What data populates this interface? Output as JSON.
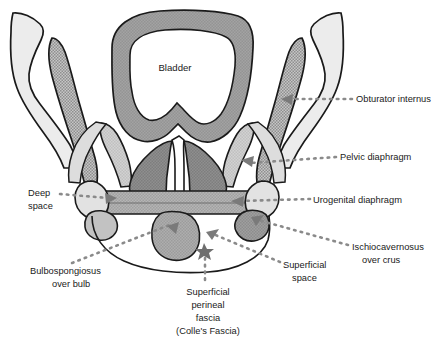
{
  "figure": {
    "background": "#ffffff"
  },
  "structures": {
    "bladder": {
      "label": "Bladder",
      "fill": "#9b9b9b",
      "stroke": "#1a1a1a"
    },
    "ilium_left": {
      "name": "ilium-left",
      "fill": "#e9e9e9",
      "stroke": "#1a1a1a"
    },
    "ilium_right": {
      "name": "ilium-right",
      "fill": "#e9e9e9",
      "stroke": "#1a1a1a"
    },
    "obturator_internus_left": {
      "name": "obturator-internus-left",
      "fill": "#b3b3b3",
      "stroke": "#1a1a1a"
    },
    "obturator_internus_right": {
      "name": "obturator-internus-right",
      "fill": "#b3b3b3",
      "stroke": "#1a1a1a"
    },
    "levator_ani_left": {
      "name": "pelvic-diaphragm-left",
      "fill": "#c9c9c9",
      "stroke": "#1a1a1a"
    },
    "levator_ani_right": {
      "name": "pelvic-diaphragm-right",
      "fill": "#c9c9c9",
      "stroke": "#1a1a1a"
    },
    "prostate_left": {
      "name": "prostate-lobe-left",
      "fill": "#8a8a8a",
      "stroke": "#1a1a1a"
    },
    "prostate_right": {
      "name": "prostate-lobe-right",
      "fill": "#8a8a8a",
      "stroke": "#1a1a1a"
    },
    "urethra": {
      "name": "urethra",
      "fill": "#ffffff",
      "stroke": "#1a1a1a"
    },
    "urogenital_diaphragm": {
      "name": "urogenital-diaphragm-band",
      "fill": "#adadad",
      "stroke": "#1a1a1a"
    },
    "ischium_left": {
      "name": "ischium-left",
      "fill": "#dcdcdc",
      "stroke": "#1a1a1a"
    },
    "ischium_right": {
      "name": "ischium-right",
      "fill": "#dcdcdc",
      "stroke": "#1a1a1a"
    },
    "crus_left": {
      "name": "crus-left",
      "fill": "#b9b9b9",
      "stroke": "#1a1a1a"
    },
    "crus_right": {
      "name": "crus-right",
      "fill": "#9a9a9a",
      "stroke": "#1a1a1a"
    },
    "bulb": {
      "name": "bulb-of-penis",
      "fill": "#a6a6a6",
      "stroke": "#1a1a1a"
    },
    "colles_fascia_line": {
      "name": "colles-fascia-curve",
      "stroke": "#1a1a1a"
    },
    "fascia_marker": {
      "name": "fascia-star-marker",
      "fill": "#6e6e6e"
    }
  },
  "labels": [
    {
      "id": "obturator-internus",
      "text": "Obturator internus",
      "x": 356,
      "y": 99,
      "anchor": "start"
    },
    {
      "id": "pelvic-diaphragm",
      "text": "Pelvic diaphragm",
      "x": 340,
      "y": 157,
      "anchor": "start"
    },
    {
      "id": "urogenital-diaphragm",
      "text": "Urogenital diaphragm",
      "x": 313,
      "y": 201,
      "anchor": "start"
    },
    {
      "id": "ischiocavernosus",
      "text": "Ischiocavernosus",
      "x": 352,
      "y": 248,
      "anchor": "start"
    },
    {
      "id": "ischiocavernosus-line2",
      "text": "over crus",
      "x": 352,
      "y": 261,
      "anchor": "start"
    },
    {
      "id": "superficial-space",
      "text": "Superficial",
      "x": 283,
      "y": 266,
      "anchor": "start"
    },
    {
      "id": "superficial-space-line2",
      "text": "space",
      "x": 283,
      "y": 279,
      "anchor": "start"
    },
    {
      "id": "deep-space",
      "text": "Deep",
      "x": 28,
      "y": 194,
      "anchor": "start"
    },
    {
      "id": "deep-space-line2",
      "text": "space",
      "x": 28,
      "y": 208,
      "anchor": "start"
    },
    {
      "id": "bulbospongiosus",
      "text": "Bulbospongiosus",
      "x": 30,
      "y": 272,
      "anchor": "start"
    },
    {
      "id": "bulbospongiosus-line2",
      "text": "over bulb",
      "x": 44,
      "y": 285,
      "anchor": "start"
    },
    {
      "id": "superficial-perineal-fascia",
      "text": "Superficial",
      "x": 208,
      "y": 293,
      "anchor": "middle"
    },
    {
      "id": "superficial-perineal-fascia-line2",
      "text": "perineal",
      "x": 208,
      "y": 306,
      "anchor": "middle"
    },
    {
      "id": "superficial-perineal-fascia-line3",
      "text": "fascia",
      "x": 208,
      "y": 319,
      "anchor": "middle"
    },
    {
      "id": "superficial-perineal-fascia-line4",
      "text": "(Colle's Fascia)",
      "x": 208,
      "y": 332,
      "anchor": "middle"
    }
  ],
  "bladder_label": {
    "text": "Bladder",
    "x": 175,
    "y": 71
  },
  "leaders": {
    "color": "#808080",
    "dot_style": "dotted",
    "arrow_color": "#7a7a7a"
  }
}
